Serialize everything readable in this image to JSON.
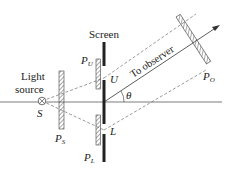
{
  "labels": {
    "screen": "Screen",
    "light_source_1": "Light",
    "light_source_2": "source",
    "s": "S",
    "ps": "P",
    "ps_sub": "S",
    "pu": "P",
    "pu_sub": "U",
    "pl": "P",
    "pl_sub": "L",
    "po": "P",
    "po_sub": "O",
    "u": "U",
    "l": "L",
    "theta": "θ",
    "to_observer": "To observer"
  },
  "colors": {
    "line": "#333333",
    "hatch": "#555555"
  }
}
